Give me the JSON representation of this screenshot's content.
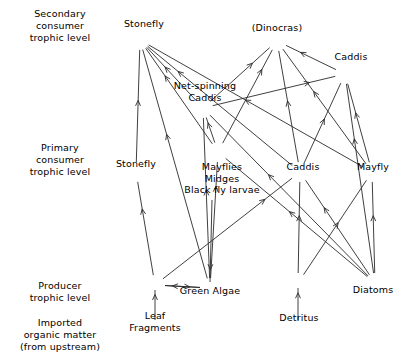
{
  "figure": {
    "width": 403,
    "height": 364,
    "background_color": "#ffffff",
    "line_color": "#2a2a2a",
    "text_color": "#000000"
  },
  "trophic_levels": [
    {
      "id": "secondary",
      "label": "Secondary\nconsumer\ntrophic level",
      "x": 60,
      "y": 8
    },
    {
      "id": "primary",
      "label": "Primary\nconsumer\ntrophic level",
      "x": 60,
      "y": 142
    },
    {
      "id": "producer",
      "label": "Producer\ntrophic level",
      "x": 60,
      "y": 280
    },
    {
      "id": "imported",
      "label": "Imported\norganic matter\n(from upstream)",
      "x": 60,
      "y": 317
    }
  ],
  "nodes": [
    {
      "id": "stonefly_sec",
      "label": "Stonefly",
      "x": 140,
      "y": 40,
      "label_x": 144,
      "label_y": 18,
      "level": "secondary"
    },
    {
      "id": "dinocras",
      "label": "(Dinocras)",
      "x": 277,
      "y": 41,
      "label_x": 277,
      "label_y": 22,
      "level": "secondary"
    },
    {
      "id": "caddis_sec",
      "label": "Caddis",
      "x": 345,
      "y": 74,
      "label_x": 351,
      "label_y": 51,
      "level": "secondary"
    },
    {
      "id": "net_caddis",
      "label": "Net-spinning\nCaddis",
      "x": 203,
      "y": 108,
      "label_x": 205,
      "label_y": 80,
      "level": "secondary"
    },
    {
      "id": "stonefly_pri",
      "label": "Stonefly",
      "x": 136,
      "y": 172,
      "label_x": 136,
      "label_y": 158,
      "level": "primary"
    },
    {
      "id": "mayflies",
      "label": "Mayflies\nMidges\nBlack fly larvae",
      "x": 218,
      "y": 152,
      "label_x": 222,
      "label_y": 161,
      "level": "primary"
    },
    {
      "id": "caddis_pri",
      "label": "Caddis",
      "x": 300,
      "y": 172,
      "label_x": 303,
      "label_y": 161,
      "level": "primary"
    },
    {
      "id": "mayfly",
      "label": "Mayfly",
      "x": 372,
      "y": 172,
      "label_x": 373,
      "label_y": 161,
      "level": "primary"
    },
    {
      "id": "green_algae",
      "label": "Green Algae",
      "x": 210,
      "y": 288,
      "label_x": 210,
      "label_y": 285,
      "level": "producer"
    },
    {
      "id": "diatoms",
      "label": "Diatoms",
      "x": 375,
      "y": 283,
      "label_x": 373,
      "label_y": 284,
      "level": "producer"
    },
    {
      "id": "leaf_fragments",
      "label": "Leaf\nFragments",
      "x": 155,
      "y": 285,
      "label_x": 155,
      "label_y": 310,
      "level": "imported"
    },
    {
      "id": "detritus",
      "label": "Detritus",
      "x": 298,
      "y": 283,
      "label_x": 299,
      "label_y": 312,
      "level": "imported"
    }
  ],
  "edges": [
    {
      "from": "stonefly_pri",
      "to": "stonefly_sec"
    },
    {
      "from": "net_caddis",
      "to": "stonefly_sec"
    },
    {
      "from": "mayflies",
      "to": "stonefly_sec"
    },
    {
      "from": "caddis_pri",
      "to": "stonefly_sec"
    },
    {
      "from": "mayfly",
      "to": "stonefly_sec"
    },
    {
      "from": "green_algae",
      "to": "stonefly_sec"
    },
    {
      "from": "net_caddis",
      "to": "dinocras"
    },
    {
      "from": "mayflies",
      "to": "dinocras"
    },
    {
      "from": "caddis_pri",
      "to": "dinocras"
    },
    {
      "from": "mayfly",
      "to": "dinocras"
    },
    {
      "from": "caddis_sec",
      "to": "dinocras"
    },
    {
      "from": "net_caddis",
      "to": "caddis_sec"
    },
    {
      "from": "caddis_pri",
      "to": "caddis_sec"
    },
    {
      "from": "mayfly",
      "to": "caddis_sec"
    },
    {
      "from": "diatoms",
      "to": "caddis_sec"
    },
    {
      "from": "mayflies",
      "to": "net_caddis"
    },
    {
      "from": "green_algae",
      "to": "net_caddis"
    },
    {
      "from": "diatoms",
      "to": "net_caddis"
    },
    {
      "from": "leaf_fragments",
      "to": "stonefly_pri"
    },
    {
      "from": "green_algae",
      "to": "mayflies"
    },
    {
      "from": "diatoms",
      "to": "mayflies"
    },
    {
      "from": "detritus",
      "to": "caddis_pri"
    },
    {
      "from": "diatoms",
      "to": "caddis_pri"
    },
    {
      "from": "leaf_fragments",
      "to": "caddis_pri"
    },
    {
      "from": "detritus",
      "to": "mayfly"
    },
    {
      "from": "diatoms",
      "to": "mayfly"
    },
    {
      "from": "leaf_fragments",
      "to": "green_algae"
    },
    {
      "from": "green_algae",
      "to": "leaf_fragments"
    }
  ],
  "standalone_arrows": [
    {
      "id": "leaf-import",
      "from_x": 155,
      "from_y": 320,
      "to_x": 155,
      "to_y": 290,
      "name": "leaf-fragments-input-arrow"
    },
    {
      "id": "detritus-import",
      "from_x": 298,
      "from_y": 320,
      "to_x": 298,
      "to_y": 288,
      "name": "detritus-input-arrow"
    },
    {
      "id": "algae-down",
      "from_x": 212,
      "from_y": 200,
      "to_x": 210,
      "to_y": 282,
      "name": "midges-to-algae-line"
    }
  ]
}
